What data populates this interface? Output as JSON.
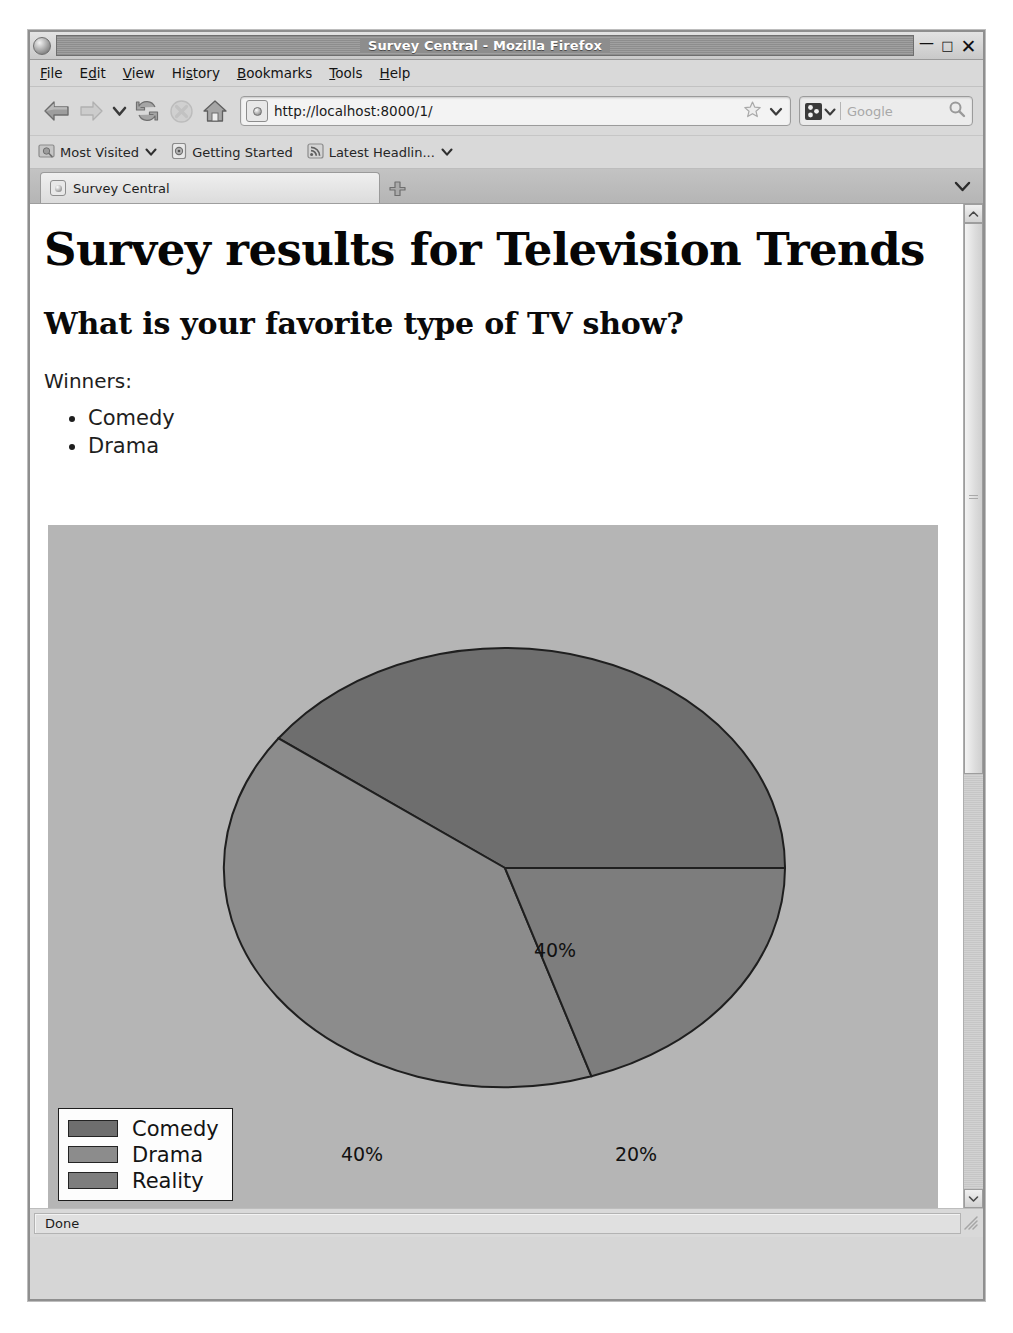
{
  "window": {
    "title": "Survey Central - Mozilla Firefox",
    "minimize_label": "—",
    "maximize_label": "□",
    "close_label": "✕"
  },
  "menubar": {
    "items": [
      {
        "label": "File"
      },
      {
        "label": "Edit"
      },
      {
        "label": "View"
      },
      {
        "label": "History"
      },
      {
        "label": "Bookmarks"
      },
      {
        "label": "Tools"
      },
      {
        "label": "Help"
      }
    ]
  },
  "toolbar": {
    "back_icon": "back-arrow-icon",
    "forward_icon": "forward-arrow-icon",
    "history_dropdown_icon": "chevron-down-icon",
    "reload_icon": "reload-icon",
    "stop_icon": "stop-icon",
    "home_icon": "home-icon",
    "url": "http://localhost:8000/1/",
    "url_placeholder": "Search or enter address",
    "bookmark_star_icon": "star-icon",
    "url_dropdown_icon": "chevron-down-icon",
    "search_placeholder": "Google",
    "search_engine_icon": "google-icon",
    "search_go_icon": "magnifier-icon"
  },
  "bookmarks": {
    "items": [
      {
        "label": "Most Visited",
        "icon": "folder-icon",
        "has_chevron": true
      },
      {
        "label": "Getting Started",
        "icon": "firefox-icon",
        "has_chevron": false
      },
      {
        "label": "Latest Headlin...",
        "icon": "rss-feed-icon",
        "has_chevron": true
      }
    ]
  },
  "tabs": {
    "active": {
      "label": "Survey Central",
      "favicon": "page-favicon"
    },
    "new_tab_label": "+",
    "tab_list_icon": "chevron-down-icon"
  },
  "page": {
    "h1": "Survey results for Television Trends",
    "h2": "What is your favorite type of TV show?",
    "winners_label": "Winners:",
    "winners": [
      "Comedy",
      "Drama"
    ]
  },
  "chart_data": {
    "type": "pie",
    "title": "",
    "categories": [
      "Comedy",
      "Drama",
      "Reality"
    ],
    "values": [
      40,
      40,
      20
    ],
    "labels": [
      "40%",
      "40%",
      "20%"
    ],
    "colors": [
      "#6e6e6e",
      "#8c8c8c",
      "#7d7d7d"
    ],
    "background": "#b5b5b5",
    "legend_position": "bottom-left",
    "legend_entries": [
      {
        "label": "Comedy",
        "color": "#6e6e6e"
      },
      {
        "label": "Drama",
        "color": "#8c8c8c"
      },
      {
        "label": "Reality",
        "color": "#7d7d7d"
      }
    ],
    "start_angle_deg": 0,
    "direction": "counterclockwise"
  },
  "statusbar": {
    "text": "Done"
  },
  "scrollbar": {
    "up_icon": "chevron-up-icon",
    "down_icon": "chevron-down-icon"
  }
}
